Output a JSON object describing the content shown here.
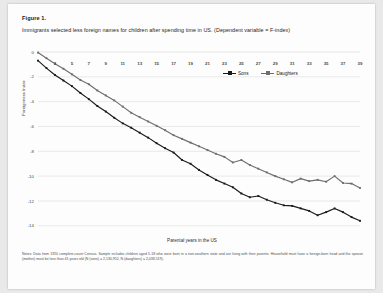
{
  "figure": {
    "number_label": "Figure 1.",
    "title": "Immigrants selected less foreign names for children after spending time in US. (Dependent variable = F-index)",
    "notes": "Notes: Data from 1920 complete-count Census. Sample includes children aged 5-18 who were born in a non-southern state and are living with their parents. Household must have a foreign-born head and the spouse (mother) must be less than 45 years old (N (sons) = 2,130,952, N (daughters) = 2,038,519)."
  },
  "chart_data": {
    "type": "line",
    "title": "Immigrants selected less foreign names for children after spending time in US. (Dependent variable = F-index)",
    "xlabel": "Parental years in the US",
    "ylabel": "Foreignness Index",
    "xlim": [
      1,
      39
    ],
    "ylim": [
      -14.5,
      0.4
    ],
    "yticks": [
      0,
      -2,
      -4,
      -6,
      -8,
      -10,
      -12,
      -14
    ],
    "ytick_labels": [
      "0",
      "-2",
      "-4",
      "-6",
      "-8",
      "-10",
      "-12",
      "-14"
    ],
    "xticks": [
      3,
      5,
      7,
      9,
      11,
      13,
      15,
      17,
      19,
      21,
      23,
      25,
      27,
      29,
      31,
      33,
      35,
      37,
      39
    ],
    "xtick_labels": [
      "3",
      "5",
      "7",
      "9",
      "11",
      "13",
      "15",
      "17",
      "19",
      "21",
      "23",
      "25",
      "27",
      "29",
      "31",
      "33",
      "35",
      "37",
      "39"
    ],
    "x": [
      1,
      2,
      3,
      4,
      5,
      6,
      7,
      8,
      9,
      10,
      11,
      12,
      13,
      14,
      15,
      16,
      17,
      18,
      19,
      20,
      21,
      22,
      23,
      24,
      25,
      26,
      27,
      28,
      29,
      30,
      31,
      32,
      33,
      34,
      35,
      36,
      37,
      38,
      39
    ],
    "grid": "horizontal",
    "legend_position": "inside-upper-right",
    "series": [
      {
        "name": "Sons",
        "color": "#1a1a1a",
        "marker": "square",
        "values": [
          -0.7,
          -1.3,
          -1.85,
          -2.3,
          -2.75,
          -3.3,
          -3.8,
          -4.35,
          -4.8,
          -5.3,
          -5.75,
          -6.1,
          -6.5,
          -6.9,
          -7.35,
          -7.75,
          -8.1,
          -8.7,
          -9.0,
          -9.5,
          -9.9,
          -10.3,
          -10.6,
          -10.9,
          -11.4,
          -11.7,
          -11.6,
          -11.9,
          -12.15,
          -12.35,
          -12.4,
          -12.6,
          -12.8,
          -13.15,
          -12.9,
          -12.6,
          -12.9,
          -13.3,
          -13.6
        ]
      },
      {
        "name": "Daughters",
        "color": "#6e6e6e",
        "marker": "square",
        "values": [
          -0.05,
          -0.5,
          -0.95,
          -1.35,
          -1.8,
          -2.25,
          -2.6,
          -3.1,
          -3.5,
          -3.9,
          -4.4,
          -4.9,
          -5.25,
          -5.6,
          -5.95,
          -6.3,
          -6.7,
          -7.0,
          -7.3,
          -7.6,
          -7.9,
          -8.2,
          -8.45,
          -8.9,
          -8.7,
          -9.1,
          -9.4,
          -9.7,
          -10.0,
          -10.25,
          -10.5,
          -10.2,
          -10.4,
          -10.3,
          -10.45,
          -10.0,
          -10.55,
          -10.6,
          -10.95
        ]
      }
    ]
  }
}
